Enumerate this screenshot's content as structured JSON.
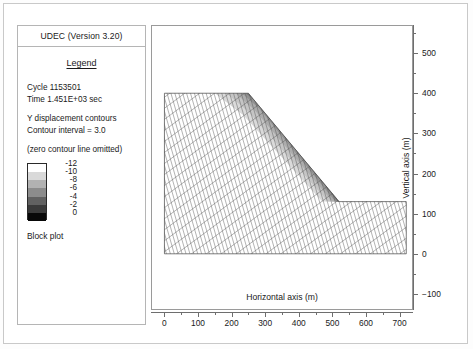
{
  "window": {
    "app_title": "UDEC (Version 3.20)"
  },
  "legend": {
    "heading": "Legend",
    "cycle": "Cycle 1153501",
    "time": "Time  1.451E+03 sec",
    "contour_type": "Y displacement contours",
    "contour_interval": "Contour interval = 3.0",
    "zero_note": "(zero contour line omitted)",
    "plot_type": "Block plot",
    "colorbar": {
      "labels": [
        "-12",
        "-10",
        "-8",
        "-6",
        "-4",
        "-2",
        "0"
      ],
      "swatches": [
        "#ffffff",
        "#d9d9d9",
        "#b2b2b2",
        "#8c8c8c",
        "#616161",
        "#3a3a3a",
        "#080808"
      ]
    }
  },
  "chart_data": {
    "type": "heatmap",
    "title": "Y displacement contours",
    "xlabel": "Horizontal axis (m)",
    "ylabel": "Vertical axis (m)",
    "xlim": [
      -40,
      740
    ],
    "ylim": [
      -140,
      570
    ],
    "xticks": [
      0,
      100,
      200,
      300,
      400,
      500,
      600,
      700
    ],
    "yticks": [
      -100,
      0,
      100,
      200,
      300,
      400,
      500
    ],
    "xticks_minor": [
      50,
      150,
      250,
      350,
      450,
      550,
      650
    ],
    "yticks_minor": [
      -50,
      50,
      150,
      250,
      350,
      450,
      550
    ],
    "grid": false,
    "legend_position": "left-panel",
    "contour_interval": 3.0,
    "contour_levels": [
      -12,
      -10,
      -8,
      -6,
      -4,
      -2,
      0
    ],
    "units": "m",
    "model_outline": [
      [
        0,
        0
      ],
      [
        0,
        400
      ],
      [
        250,
        400
      ],
      [
        520,
        130
      ],
      [
        720,
        130
      ],
      [
        720,
        0
      ]
    ],
    "mesh": {
      "description": "rhombic block mesh, diagonal joint sets",
      "spacing_m": 25,
      "skew_deg": 12
    },
    "contour_bands": [
      {
        "level": -2,
        "shade": "#3a3a3a",
        "region": "slope crest innermost"
      },
      {
        "level": -4,
        "shade": "#616161",
        "region": "crest"
      },
      {
        "level": -6,
        "shade": "#8c8c8c",
        "region": "upper slope"
      },
      {
        "level": -8,
        "shade": "#b2b2b2",
        "region": "mid slope"
      },
      {
        "level": -10,
        "shade": "#d9d9d9",
        "region": "lower slope"
      },
      {
        "level": -12,
        "shade": "#ffffff",
        "region": "remaining body"
      }
    ]
  }
}
